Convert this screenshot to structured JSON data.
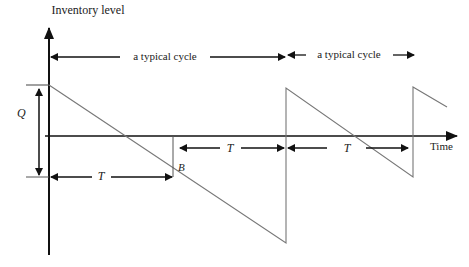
{
  "diagram": {
    "type": "inventory-sawtooth",
    "y_axis_label": "Inventory level",
    "x_axis_label": "Time",
    "cycle_labels": [
      "a typical cycle",
      "a typical cycle"
    ],
    "quantity_label": "Q",
    "period_labels": [
      "T",
      "T",
      "T"
    ],
    "backorder_label": "B",
    "colors": {
      "axis": "#111111",
      "curve": "#777777",
      "text": "#222222"
    }
  }
}
